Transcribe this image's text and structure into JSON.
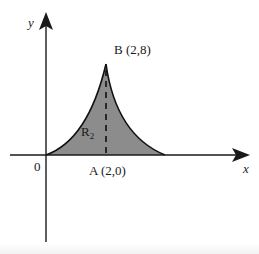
{
  "figure": {
    "axes": {
      "x_label": "x",
      "y_label": "y",
      "origin_label": "0"
    },
    "points": {
      "A": {
        "name": "A",
        "coords": "(2,0)",
        "text": "A (2,0)"
      },
      "B": {
        "name": "B",
        "coords": "(2,8)",
        "text": "B (2,8)"
      }
    },
    "region": {
      "label_main": "R",
      "label_sub": "2",
      "fill_color": "#8c8c8c"
    },
    "colors": {
      "axis": "#1a1a1a",
      "curve": "#111111",
      "dashed": "#111111",
      "background": "#ffffff"
    }
  }
}
